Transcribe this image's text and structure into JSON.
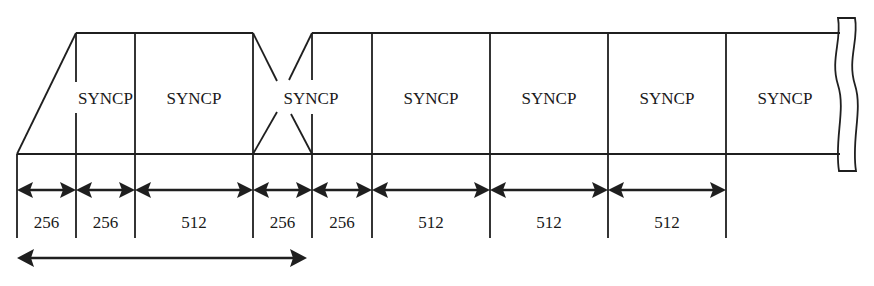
{
  "diagram": {
    "type": "frame-structure",
    "fields": [
      {
        "label": "SYNCP",
        "x_start": 76,
        "x_end": 135
      },
      {
        "label": "SYNCP",
        "x_start": 135,
        "x_end": 253
      },
      {
        "label": "SYNCP",
        "x_start": 253,
        "x_end": 312
      },
      {
        "label": "SYNCP",
        "x_start": 372,
        "x_end": 490
      },
      {
        "label": "SYNCP",
        "x_start": 490,
        "x_end": 608
      },
      {
        "label": "SYNCP",
        "x_start": 608,
        "x_end": 726
      },
      {
        "label": "SYNCP",
        "x_start": 726,
        "x_end": 838
      }
    ],
    "durations": [
      {
        "value": "256",
        "x_start": 17,
        "x_end": 76
      },
      {
        "value": "256",
        "x_start": 76,
        "x_end": 135
      },
      {
        "value": "512",
        "x_start": 135,
        "x_end": 253
      },
      {
        "value": "256",
        "x_start": 253,
        "x_end": 312
      },
      {
        "value": "256",
        "x_start": 312,
        "x_end": 372
      },
      {
        "value": "512",
        "x_start": 372,
        "x_end": 490
      },
      {
        "value": "512",
        "x_start": 490,
        "x_end": 608
      },
      {
        "value": "512",
        "x_start": 608,
        "x_end": 726
      }
    ],
    "bottom_span": {
      "x_start": 17,
      "x_end": 307,
      "label": ""
    },
    "colors": {
      "line": "#1f1f1f",
      "background": "#ffffff",
      "text": "#1a1a1a"
    }
  }
}
